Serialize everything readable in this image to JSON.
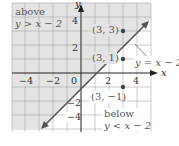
{
  "graph": {
    "equation": "y = x − 2",
    "axes": {
      "x_label": "x",
      "y_label": "y"
    },
    "x_ticks": [
      "−4",
      "−2",
      "0",
      "2",
      "4"
    ],
    "y_ticks": [
      "4",
      "2",
      "−2",
      "−4"
    ],
    "regions": {
      "above": {
        "title": "above",
        "inequality": "y > x − 2"
      },
      "below": {
        "title": "below",
        "inequality": "y < x − 2"
      }
    },
    "points": [
      {
        "label": "(3, 3)",
        "x": 3,
        "y": 3
      },
      {
        "label": "(3, 1)",
        "x": 3,
        "y": 1
      },
      {
        "label": "(3, −1)",
        "x": 3,
        "y": -1
      }
    ],
    "colors": {
      "shade": "#e3e3e3",
      "grid": "#9a9a9a",
      "line": "#555555",
      "point": "#444444"
    }
  }
}
